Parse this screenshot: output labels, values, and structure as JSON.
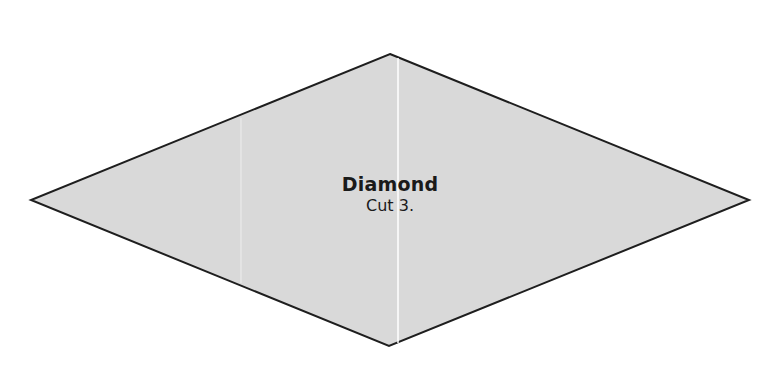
{
  "template": {
    "shape": "diamond",
    "title": "Diamond",
    "instruction": "Cut 3.",
    "fill_color": "#d9d9d9",
    "stroke_color": "#1e1e1e",
    "fold_line_color": "#ffffff",
    "vertices": {
      "top": [
        390,
        54
      ],
      "right": [
        749,
        200
      ],
      "bottom": [
        389,
        346
      ],
      "left": [
        31,
        200
      ]
    }
  }
}
